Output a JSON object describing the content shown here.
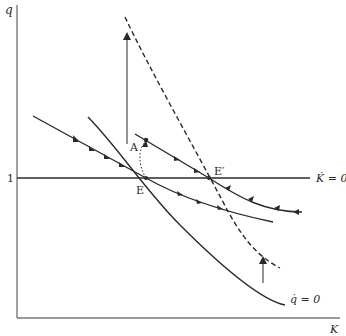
{
  "diagram": {
    "type": "phase-diagram",
    "axes": {
      "y_label": "q",
      "x_label": "K",
      "y_tick": "1"
    },
    "loci": {
      "k_dot_zero": "K̇ = 0",
      "q_dot_zero": "q̇ = 0"
    },
    "points": {
      "E": "E",
      "E_prime": "E′",
      "A": "A"
    },
    "colors": {
      "line": "#2a2a2a",
      "axis": "#7a7a7a",
      "background": "#ffffff"
    }
  }
}
